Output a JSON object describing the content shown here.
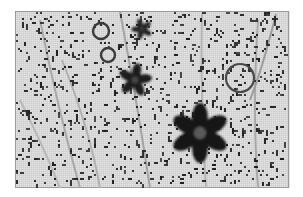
{
  "image": {
    "width": 303,
    "height": 197,
    "background": "#ffffff",
    "panel": {
      "x": 15,
      "y": 11,
      "width": 274,
      "height": 177,
      "fill": "#e4e4e4",
      "grid_color": "#c9c9c9",
      "grid_step": 2,
      "border": "#9a9a9a"
    },
    "noise": {
      "color": "#1e1e1e",
      "count": 900,
      "seed": 7
    },
    "stems": [
      {
        "points": [
          [
            40,
            20
          ],
          [
            58,
            110
          ],
          [
            80,
            188
          ]
        ],
        "color": "#a8a8a8",
        "width": 2
      },
      {
        "points": [
          [
            62,
            60
          ],
          [
            90,
            130
          ],
          [
            100,
            188
          ]
        ],
        "color": "#b0b0b0",
        "width": 2
      },
      {
        "points": [
          [
            120,
            12
          ],
          [
            135,
            90
          ],
          [
            150,
            188
          ]
        ],
        "color": "#a4a4a4",
        "width": 2
      },
      {
        "points": [
          [
            202,
            14
          ],
          [
            200,
            90
          ],
          [
            206,
            188
          ]
        ],
        "color": "#b4b4b4",
        "width": 2
      },
      {
        "points": [
          [
            258,
            20
          ],
          [
            252,
            110
          ],
          [
            258,
            188
          ]
        ],
        "color": "#a8a8a8",
        "width": 2
      },
      {
        "points": [
          [
            276,
            14
          ],
          [
            262,
            70
          ],
          [
            250,
            100
          ]
        ],
        "color": "#9c9c9c",
        "width": 2
      },
      {
        "points": [
          [
            20,
            100
          ],
          [
            45,
            150
          ],
          [
            60,
            188
          ]
        ],
        "color": "#b8b8b8",
        "width": 2
      }
    ],
    "circles": [
      {
        "cx": 101,
        "cy": 31,
        "r": 8,
        "stroke": "#3a3a3a",
        "width": 2.4
      },
      {
        "cx": 108,
        "cy": 55,
        "r": 7,
        "stroke": "#3a3a3a",
        "width": 2.4
      },
      {
        "cx": 240,
        "cy": 78,
        "r": 14,
        "stroke": "#4a4a4a",
        "width": 2.2
      }
    ],
    "flowers": [
      {
        "cx": 142,
        "cy": 29,
        "r": 10,
        "petals": 5,
        "fill": "#222222",
        "center": "#3c3c3c",
        "rotate": -20
      },
      {
        "cx": 135,
        "cy": 80,
        "r": 16,
        "petals": 5,
        "fill": "#1c1c1c",
        "center": "#444444",
        "rotate": 10
      },
      {
        "cx": 200,
        "cy": 133,
        "r": 28,
        "petals": 6,
        "fill": "#141414",
        "center": "#5a5a5a",
        "rotate": 0
      }
    ]
  }
}
